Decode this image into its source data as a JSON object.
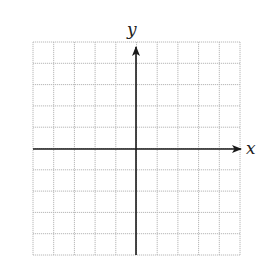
{
  "diagram": {
    "type": "coordinate-grid",
    "grid": {
      "columns": 10,
      "rows": 10,
      "left": 33,
      "top": 42,
      "right": 240,
      "bottom": 255,
      "line_color": "#b8b8b8",
      "line_style": "dotted"
    },
    "axes": {
      "origin": {
        "x": 136,
        "y": 149
      },
      "color": "#1a1a1a",
      "x_axis": {
        "label": "x",
        "arrow": "right"
      },
      "y_axis": {
        "label": "y",
        "arrow": "up"
      }
    }
  }
}
